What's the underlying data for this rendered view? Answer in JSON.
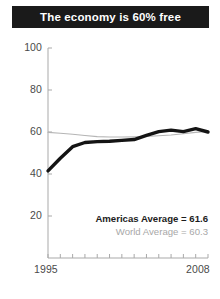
{
  "title": "The economy is 60% free",
  "legend": {
    "primary": "Americas Average = 61.6",
    "secondary": "World Average = 60.3"
  },
  "axis": {
    "y_ticks": [
      "100",
      "80",
      "60",
      "40",
      "20"
    ],
    "x_first": "1995",
    "x_last": "2008"
  },
  "colors": {
    "banner_bg": "#1a1a1a",
    "banner_text": "#ffffff",
    "americas_line": "#141414",
    "world_line": "#b5b5b5",
    "axis": "#a9a9a9",
    "tick_text": "#4a4a4a"
  },
  "chart_data": {
    "type": "line",
    "title": "The economy is 60% free",
    "xlabel": "",
    "ylabel": "",
    "xlim": [
      1995,
      2008
    ],
    "ylim": [
      0,
      100
    ],
    "yticks": [
      20,
      40,
      60,
      80,
      100
    ],
    "xticks": [
      1995,
      1996,
      1997,
      1998,
      1999,
      2000,
      2001,
      2002,
      2003,
      2004,
      2005,
      2006,
      2007,
      2008
    ],
    "xtick_labels_shown": [
      "1995",
      "2008"
    ],
    "grid": false,
    "legend_position": "inside-lower-right",
    "x": [
      1995,
      1996,
      1997,
      1998,
      1999,
      2000,
      2001,
      2002,
      2003,
      2004,
      2005,
      2006,
      2007,
      2008
    ],
    "series": [
      {
        "name": "Americas Average",
        "color": "#141414",
        "width": "thick",
        "final_value": 61.6,
        "values": [
          41.5,
          47.5,
          53.0,
          55.0,
          55.4,
          55.6,
          56.0,
          56.4,
          58.4,
          60.2,
          60.9,
          60.2,
          61.6,
          60.0
        ]
      },
      {
        "name": "World Average",
        "color": "#b5b5b5",
        "width": "thin",
        "final_value": 60.3,
        "values": [
          59.8,
          59.4,
          58.9,
          58.3,
          57.8,
          57.6,
          57.6,
          57.7,
          57.9,
          58.2,
          58.6,
          59.2,
          59.8,
          60.3
        ]
      }
    ]
  }
}
